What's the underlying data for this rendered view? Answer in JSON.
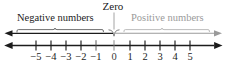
{
  "figure": {
    "type": "number-line-diagram",
    "labels": {
      "zero": "Zero",
      "negative": "Negative numbers",
      "positive": "Positive numbers"
    },
    "colors": {
      "line": "#1c1c1c",
      "negative_text": "#1c1c1c",
      "positive_text": "#9a9a9a",
      "zero_text": "#1a1a1a",
      "brace_left": "#555555",
      "brace_right": "#aaaaaa",
      "arrow_left": "#1c1c1c",
      "arrow_right": "#9a9a9a",
      "background": "#ffffff"
    },
    "axis": {
      "min": -5,
      "max": 5,
      "step": 1,
      "arrows_both_ends": true
    },
    "ticks": [
      {
        "value": -5,
        "text": "−5",
        "x": 36
      },
      {
        "value": -4,
        "text": "−4",
        "x": 51
      },
      {
        "value": -3,
        "text": "−3",
        "x": 66
      },
      {
        "value": -2,
        "text": "−2",
        "x": 81
      },
      {
        "value": -1,
        "text": "−1",
        "x": 96
      },
      {
        "value": 0,
        "text": "0",
        "x": 114
      },
      {
        "value": 1,
        "text": "1",
        "x": 130
      },
      {
        "value": 2,
        "text": "2",
        "x": 145
      },
      {
        "value": 3,
        "text": "3",
        "x": 160
      },
      {
        "value": 4,
        "text": "4",
        "x": 175
      },
      {
        "value": 5,
        "text": "5",
        "x": 190
      }
    ]
  },
  "chart_data": {
    "type": "line",
    "xlabel": "",
    "ylabel": "",
    "xlim": [
      -5,
      5
    ],
    "categories": [
      "−5",
      "−4",
      "−3",
      "−2",
      "−1",
      "0",
      "1",
      "2",
      "3",
      "4",
      "5"
    ],
    "values": [
      -5,
      -4,
      -3,
      -2,
      -1,
      0,
      1,
      2,
      3,
      4,
      5
    ],
    "annotations": [
      "Negative numbers",
      "Zero",
      "Positive numbers"
    ],
    "grid": false,
    "legend": "none"
  }
}
